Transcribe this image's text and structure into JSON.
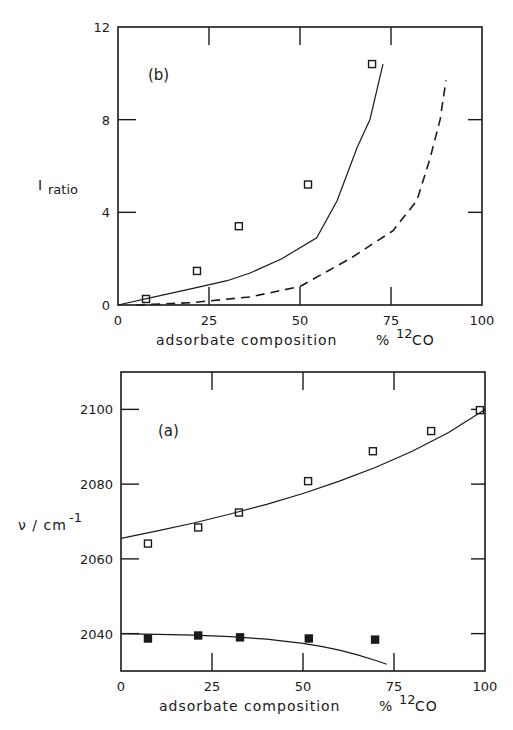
{
  "chart_data": [
    {
      "panel": "(b)",
      "type": "scatter",
      "title": "",
      "xlabel": "adsorbate composition   % 12CO",
      "ylabel": "I ratio",
      "xlim": [
        0,
        100
      ],
      "ylim": [
        0,
        12
      ],
      "xticks": [
        0,
        25,
        50,
        75,
        100
      ],
      "yticks": [
        0,
        4,
        8,
        12
      ],
      "grid": false,
      "legend": null,
      "series": [
        {
          "name": "experimental",
          "style": "open-square-markers",
          "x": [
            7.7,
            21.7,
            33.2,
            52.2,
            69.8
          ],
          "y": [
            0.26,
            1.47,
            3.4,
            5.2,
            10.4
          ]
        },
        {
          "name": "calculated (solid)",
          "style": "solid-line",
          "x": [
            0,
            10,
            20,
            30,
            36.3,
            45,
            54.6,
            60.2,
            65.7,
            69.2,
            72.8
          ],
          "y": [
            0,
            0.35,
            0.7,
            1.05,
            1.38,
            2.0,
            2.9,
            4.5,
            6.8,
            8.0,
            10.4
          ]
        },
        {
          "name": "calculated (dashed)",
          "style": "dashed-line",
          "x": [
            5,
            20,
            36.3,
            50,
            63.7,
            75.5,
            82.1,
            85.7,
            88.5,
            90.1
          ],
          "y": [
            0,
            0.1,
            0.35,
            0.8,
            2.0,
            3.2,
            4.5,
            6.3,
            8.0,
            9.7
          ]
        }
      ]
    },
    {
      "panel": "(a)",
      "type": "scatter",
      "title": "",
      "xlabel": "adsorbate composition   % 12CO",
      "ylabel": "ν / cm-1",
      "xlim": [
        0,
        100
      ],
      "ylim": [
        2030,
        2110
      ],
      "xticks": [
        0,
        25,
        50,
        75,
        100
      ],
      "yticks": [
        2040,
        2060,
        2080,
        2100
      ],
      "grid": false,
      "legend": null,
      "series": [
        {
          "name": "high-frequency band",
          "style": "open-square-markers",
          "x": [
            7.4,
            21.2,
            32.4,
            51.4,
            69.2,
            85.2,
            98.6
          ],
          "y": [
            2064.1,
            2068.4,
            2072.4,
            2080.8,
            2088.8,
            2094.2,
            2099.8
          ]
        },
        {
          "name": "high-frequency fit",
          "style": "solid-line",
          "x": [
            0,
            10,
            20,
            30,
            40,
            50,
            60,
            70,
            80,
            90,
            100
          ],
          "y": [
            2065.5,
            2067.5,
            2069.6,
            2072.0,
            2074.6,
            2077.5,
            2080.8,
            2084.5,
            2088.8,
            2093.8,
            2100.0
          ]
        },
        {
          "name": "low-frequency band",
          "style": "filled-square-markers",
          "x": [
            7.4,
            21.2,
            32.7,
            51.6,
            69.8
          ],
          "y": [
            2038.7,
            2039.5,
            2039.0,
            2038.7,
            2038.4
          ]
        },
        {
          "name": "low-frequency fit",
          "style": "solid-line",
          "x": [
            0,
            10,
            20,
            30,
            40,
            50,
            55,
            60,
            65,
            70,
            73
          ],
          "y": [
            2040.0,
            2039.8,
            2039.6,
            2039.2,
            2038.5,
            2037.4,
            2036.6,
            2035.6,
            2034.3,
            2032.8,
            2031.8
          ]
        }
      ]
    }
  ],
  "labels": {
    "panel_b": "(b)",
    "panel_a": "(a)",
    "ylabel_b_main": "I",
    "ylabel_b_sub": "ratio",
    "ylabel_a_main": "ν / cm",
    "ylabel_a_sup": "-1",
    "xlabel_text": "adsorbate composition",
    "xlabel_unit_pct": "%",
    "xlabel_unit_sup": "12",
    "xlabel_unit_co": "CO"
  }
}
